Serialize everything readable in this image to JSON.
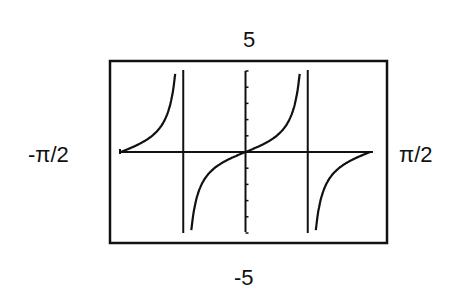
{
  "chart_data": {
    "type": "line",
    "title": "",
    "function": "y = tan(2x)",
    "xlabel": "",
    "ylabel": "",
    "xlim": [
      "-π/2",
      "π/2"
    ],
    "ylim": [
      -5,
      5
    ],
    "x_tick_labels": [
      "-π/2",
      "π/2"
    ],
    "y_tick_labels": [
      "5",
      "-5"
    ],
    "asymptotes": [
      "-π/4",
      "π/4"
    ],
    "grid": false,
    "y_axis_ticks": 10,
    "series": [
      {
        "name": "tan(2x)",
        "x": [
          "-π/2",
          "-3π/8",
          "-π/4",
          "-π/8",
          "0",
          "π/8",
          "π/4",
          "3π/8",
          "π/2"
        ],
        "values": [
          0,
          1,
          "asymptote",
          -1,
          0,
          1,
          "asymptote",
          -1,
          0
        ]
      }
    ]
  },
  "labels": {
    "ymax": "5",
    "ymin": "-5",
    "xmin": "-π/2",
    "xmax": "π/2"
  }
}
